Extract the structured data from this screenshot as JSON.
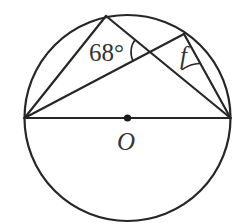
{
  "diagram": {
    "circle": {
      "cx": 127.5,
      "cy": 118,
      "r": 103
    },
    "center": {
      "x": 127.5,
      "y": 118,
      "label": "O"
    },
    "points": {
      "A": {
        "x": 24.5,
        "y": 118
      },
      "B": {
        "x": 230.5,
        "y": 118
      },
      "C": {
        "x": 106,
        "y": 16
      },
      "D": {
        "x": 184,
        "y": 34
      }
    },
    "segments": [
      {
        "from": "A",
        "to": "B",
        "role": "diameter"
      },
      {
        "from": "A",
        "to": "C"
      },
      {
        "from": "C",
        "to": "B"
      },
      {
        "from": "A",
        "to": "D"
      },
      {
        "from": "D",
        "to": "B"
      }
    ],
    "intersection": {
      "x": 151,
      "y": 52
    },
    "angles": [
      {
        "label": "68°",
        "vertex": "intersection of AD and CB",
        "value_deg": 68
      },
      {
        "label": "f",
        "vertex": "D",
        "unknown": true
      }
    ],
    "labels": {
      "angle_68": "68°",
      "angle_f": "f",
      "center": "O"
    }
  }
}
